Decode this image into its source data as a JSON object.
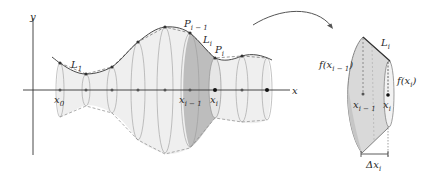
{
  "figure": {
    "colors": {
      "curve": "#4a4a4a",
      "axis": "#333333",
      "surface_fill": "#ededed",
      "highlight_fill": "#b9b9b9",
      "dashed": "#8a8a8a",
      "points": "#333333"
    },
    "axes": {
      "y_label": "y",
      "x_label": "x"
    },
    "left_panel": {
      "labels": {
        "x0": "x",
        "x0_sub": "0",
        "x_im1": "x",
        "x_im1_sub": "i − 1",
        "x_i": "x",
        "x_i_sub": "i",
        "L1": "L",
        "L1_sub": "1",
        "P_im1": "P",
        "P_im1_sub": "i − 1",
        "L_i": "L",
        "L_i_sub": "i",
        "P_i": "P",
        "P_i_sub": "i"
      }
    },
    "arrow": {
      "meaning": "magnify-frustum"
    },
    "right_panel": {
      "labels": {
        "L_i": "L",
        "L_i_sub": "i",
        "f_left": "f(x",
        "f_left_sub": "i − 1",
        "f_left_close": ")",
        "f_right": "f(x",
        "f_right_sub": "i",
        "f_right_close": ")",
        "x_im1": "x",
        "x_im1_sub": "i − 1",
        "x_i": "x",
        "x_i_sub": "i",
        "dx": "Δx",
        "dx_sub": "i"
      }
    }
  }
}
